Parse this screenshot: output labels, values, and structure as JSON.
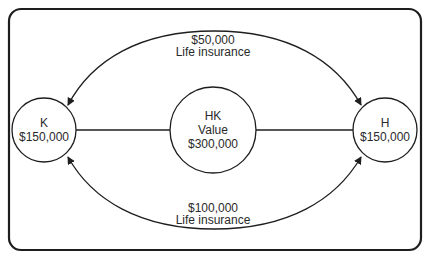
{
  "diagram": {
    "colors": {
      "stroke": "#1e1e1e",
      "text": "#2a2a2a",
      "background": "#ffffff"
    },
    "nodes": [
      {
        "id": "K",
        "lines": [
          "K",
          "$150,000"
        ]
      },
      {
        "id": "HK",
        "lines": [
          "HK",
          "Value",
          "$300,000"
        ]
      },
      {
        "id": "H",
        "lines": [
          "H",
          "$150,000"
        ]
      }
    ],
    "edges": [
      {
        "from": "K",
        "to": "HK",
        "type": "line"
      },
      {
        "from": "HK",
        "to": "H",
        "type": "line"
      },
      {
        "from": "top-arc",
        "to": [
          "K",
          "H"
        ],
        "type": "bidirectional-arrow",
        "label": [
          "$50,000",
          "Life insurance"
        ]
      },
      {
        "from": "bottom-arc",
        "to": [
          "K",
          "H"
        ],
        "type": "bidirectional-arrow",
        "label": [
          "$100,000",
          "Life insurance"
        ]
      }
    ]
  }
}
